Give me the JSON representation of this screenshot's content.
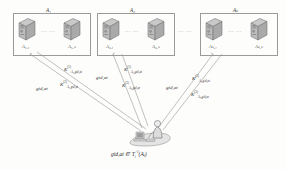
{
  "diagram": {
    "type": "network-diagram",
    "background_color": "#fdfdfc",
    "line_color": "#8d8d8d",
    "box_border_color": "#9a9a9a"
  },
  "authority_groups": [
    {
      "id": "group-1",
      "title": "A₁",
      "title_plain": "A_1",
      "ellipsis": "... ...",
      "nodes": [
        {
          "id": "node-a1-1",
          "label": "A₁,₁",
          "label_plain": "A_{1,1}",
          "icon": "server-tower-icon"
        },
        {
          "id": "node-a1-n",
          "label": "A₁,ₙ",
          "label_plain": "A_{1,n}",
          "icon": "server-tower-icon"
        }
      ]
    },
    {
      "id": "group-2",
      "title": "A₂",
      "title_plain": "A_2",
      "ellipsis": "... ...",
      "nodes": [
        {
          "id": "node-a2-1",
          "label": "A₂,₁",
          "label_plain": "A_{2,1}",
          "icon": "server-tower-icon"
        },
        {
          "id": "node-a2-n",
          "label": "A₂,ₙ",
          "label_plain": "A_{2,n}",
          "icon": "server-tower-icon"
        }
      ]
    },
    {
      "id": "group-k",
      "title": "Aₖ",
      "title_plain": "A_k",
      "ellipsis": "... ...",
      "nodes": [
        {
          "id": "node-ak-1",
          "label": "Aₖ,₁",
          "label_plain": "A_{k,1}",
          "icon": "server-tower-icon"
        },
        {
          "id": "node-ak-n",
          "label": "Aₖ,ₙ",
          "label_plain": "A_{k,n}",
          "icon": "server-tower-icon"
        }
      ]
    }
  ],
  "group_separator": "... ...",
  "edge_labels": {
    "left": {
      "request": "gid,at",
      "key1_base": "K",
      "key1_sup": "(1)",
      "key1_sub": "A₁,gid,at",
      "key2_base": "K",
      "key2_sup": "(2)",
      "key2_sub": "A₁,gid,at"
    },
    "middle": {
      "request": "gid,at",
      "key1_base": "K",
      "key1_sup": "(1)",
      "key1_sub": "A₂,gid,at",
      "key2_base": "K",
      "key2_sup": "(2)",
      "key2_sub": "A₂,gid,at"
    },
    "right": {
      "request": "gid,at",
      "key1_base": "K",
      "key1_sup": "(1)",
      "key1_sub": "Aₖ,gid,at",
      "key2_base": "K",
      "key2_sup": "(2)",
      "key2_sub": "Aₖ,gid,at"
    }
  },
  "user": {
    "icon": "user-at-desk-icon",
    "caption_prefix": "gid,at ∈ T",
    "caption_sub": "i",
    "caption_sup": "-1",
    "caption_suffix": "(Aⱼ)",
    "caption_plain": "gid,at ∈ T_i^{-1}(A_j)"
  }
}
